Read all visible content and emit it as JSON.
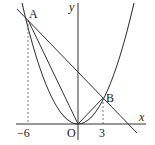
{
  "diagram": {
    "type": "coordinate-geometry",
    "axes": {
      "x_label": "x",
      "y_label": "y",
      "origin_label": "O"
    },
    "points": [
      {
        "label": "A",
        "x": -6
      },
      {
        "label": "B",
        "x": 3
      }
    ],
    "tick_labels": {
      "a_x": "−6",
      "b_x": "3"
    },
    "colors": {
      "stroke": "#333333",
      "background": "#ffffff"
    }
  }
}
